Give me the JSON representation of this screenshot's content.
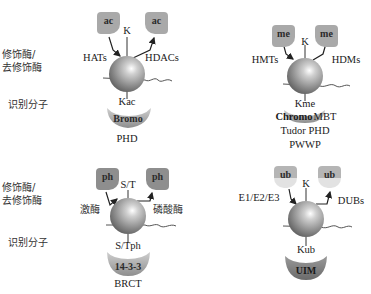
{
  "row_labels": {
    "top_modifier": "修饰酶/\n去修饰酶",
    "top_modifier_line1": "修饰酶/",
    "top_modifier_line2": "去修饰酶",
    "top_reader": "识别分子",
    "bottom_modifier_line1": "修饰酶/",
    "bottom_modifier_line2": "去修饰酶",
    "bottom_reader": "识别分子"
  },
  "panels": [
    {
      "id": "acetylation",
      "tag": "ac",
      "residue": "K",
      "writer": "HATs",
      "eraser": "HDACs",
      "modified_residue": "Kac",
      "reader_domain": "Bromo",
      "other_readers": [
        "PHD"
      ]
    },
    {
      "id": "methylation",
      "tag": "me",
      "residue": "K",
      "writer": "HMTs",
      "eraser": "HDMs",
      "modified_residue": "Kme",
      "reader_domain": "Chromo",
      "other_readers": [
        "MBT",
        "Tudor PHD",
        "PWWP"
      ]
    },
    {
      "id": "phosphorylation",
      "tag": "ph",
      "residue": "S/T",
      "writer": "激酶",
      "eraser": "磷酸酶",
      "modified_residue": "S/Tph",
      "reader_domain": "14-3-3",
      "other_readers": [
        "BRCT"
      ]
    },
    {
      "id": "ubiquitination",
      "tag": "ub",
      "residue": "K",
      "writer": "E1/E2/E3",
      "eraser": "DUBs",
      "modified_residue": "Kub",
      "reader_domain": "UIM",
      "other_readers": []
    }
  ],
  "colors": {
    "tag_fill": "#a9a9a9",
    "reader_fill": "#9a9a9a",
    "sphere_dark": "#3a3a3a",
    "sphere_light": "#ffffff",
    "line": "#333333"
  }
}
